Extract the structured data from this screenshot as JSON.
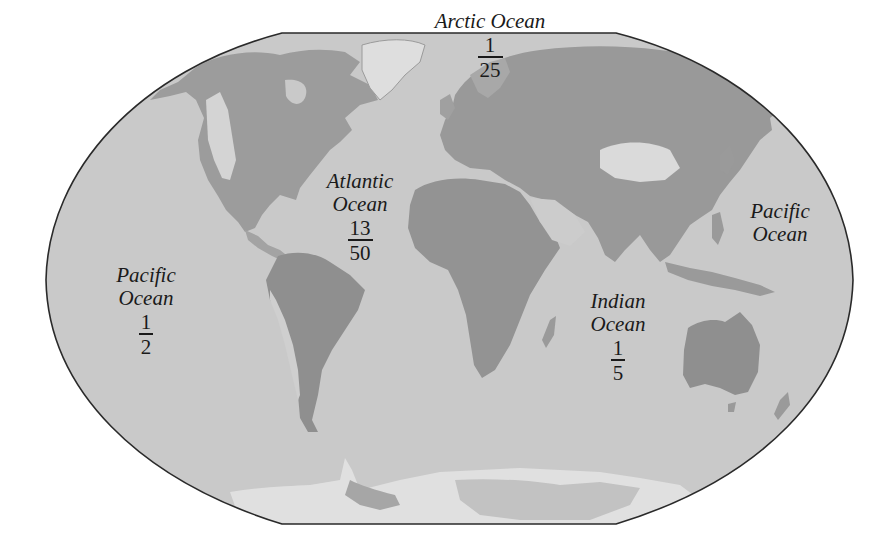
{
  "map": {
    "colors": {
      "ocean": "#c9c9c9",
      "outline": "#2a2a2a",
      "land_low": "#8d8d8d",
      "land_mid": "#a6a6a6",
      "land_high": "#dcdcdc",
      "ice": "#e2e2e2",
      "background": "#ffffff"
    },
    "oceans": [
      {
        "id": "arctic",
        "name_lines": [
          "Arctic Ocean"
        ],
        "fraction": {
          "numerator": "1",
          "denominator": "25"
        }
      },
      {
        "id": "atlantic",
        "name_lines": [
          "Atlantic",
          "Ocean"
        ],
        "fraction": {
          "numerator": "13",
          "denominator": "50"
        }
      },
      {
        "id": "pacific-west",
        "name_lines": [
          "Pacific",
          "Ocean"
        ],
        "fraction": {
          "numerator": "1",
          "denominator": "2"
        }
      },
      {
        "id": "indian",
        "name_lines": [
          "Indian",
          "Ocean"
        ],
        "fraction": {
          "numerator": "1",
          "denominator": "5"
        }
      },
      {
        "id": "pacific-east",
        "name_lines": [
          "Pacific",
          "Ocean"
        ],
        "fraction": null
      }
    ]
  }
}
